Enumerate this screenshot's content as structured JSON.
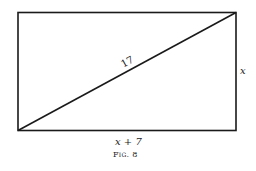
{
  "figure": {
    "caption": "Fig. 8",
    "shape": "rectangle-with-diagonal",
    "labels": {
      "diagonal": "17",
      "right_side": "x",
      "bottom_side": "x + 7"
    },
    "stroke_color": "#1a1a1a"
  }
}
